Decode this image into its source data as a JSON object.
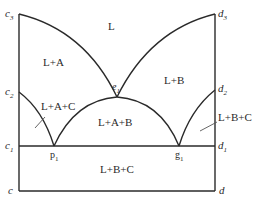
{
  "diagram": {
    "left_axis_labels": [
      {
        "id": "c3",
        "base": "c",
        "sub": "3"
      },
      {
        "id": "c2",
        "base": "c",
        "sub": "2"
      },
      {
        "id": "c1",
        "base": "c",
        "sub": "1"
      },
      {
        "id": "c",
        "base": "c",
        "sub": ""
      }
    ],
    "right_axis_labels": [
      {
        "id": "d3",
        "base": "d",
        "sub": "3"
      },
      {
        "id": "d2",
        "base": "d",
        "sub": "2"
      },
      {
        "id": "d1",
        "base": "d",
        "sub": "1"
      },
      {
        "id": "d",
        "base": "d",
        "sub": ""
      }
    ],
    "points": [
      {
        "id": "e1",
        "base": "e",
        "sub": "1"
      },
      {
        "id": "p1",
        "base": "p",
        "sub": "1"
      },
      {
        "id": "g1",
        "base": "g",
        "sub": "1"
      }
    ],
    "regions": {
      "L": "L",
      "LA": "L+A",
      "LB": "L+B",
      "LAC": "L+A+C",
      "LAB": "L+A+B",
      "LBC_right": "L+B+C",
      "LBC_bottom": "L+B+C"
    }
  }
}
